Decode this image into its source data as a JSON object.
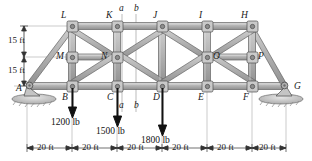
{
  "figure": {
    "type": "truss-diagram",
    "colors": {
      "member_fill": "#b9b9b9",
      "member_edge": "#5a5a5a",
      "joint_fill": "#d8d8d8",
      "joint_edge": "#4a4a4a",
      "load_arrow": "#111111",
      "dimension_line": "#7a7a7a",
      "section_line": "#9a9a9a",
      "ground_hatch": "#8c8c8c"
    }
  },
  "joints": {
    "bottom_chord": [
      {
        "id": "A",
        "label": "A",
        "x_ft": 0,
        "label_pos": "left-above"
      },
      {
        "id": "B",
        "label": "B",
        "x_ft": 20,
        "label_pos": "left-below"
      },
      {
        "id": "C",
        "label": "C",
        "x_ft": 40,
        "label_pos": "left-below"
      },
      {
        "id": "D",
        "label": "D",
        "x_ft": 60,
        "label_pos": "left-below"
      },
      {
        "id": "E",
        "label": "E",
        "x_ft": 80,
        "label_pos": "left-below"
      },
      {
        "id": "F",
        "label": "F",
        "x_ft": 100,
        "label_pos": "left-below"
      },
      {
        "id": "G",
        "label": "G",
        "x_ft": 120,
        "label_pos": "right-above"
      }
    ],
    "top_chord": [
      {
        "id": "L",
        "label": "L",
        "x_ft": 20,
        "label_pos": "left-above"
      },
      {
        "id": "K",
        "label": "K",
        "x_ft": 40,
        "label_pos": "left-above"
      },
      {
        "id": "J",
        "label": "J",
        "x_ft": 60,
        "label_pos": "left-above"
      },
      {
        "id": "I",
        "label": "I",
        "x_ft": 80,
        "label_pos": "left-above"
      },
      {
        "id": "H",
        "label": "H",
        "x_ft": 100,
        "label_pos": "left-above"
      }
    ],
    "mid_chord": [
      {
        "id": "M",
        "label": "M",
        "x_ft": 20,
        "label_pos": "left"
      },
      {
        "id": "N",
        "label": "N",
        "x_ft": 40,
        "label_pos": "left"
      },
      {
        "id": "O",
        "label": "O",
        "x_ft": 80,
        "label_pos": "right"
      },
      {
        "id": "P",
        "label": "P",
        "x_ft": 100,
        "label_pos": "right"
      }
    ]
  },
  "heights": {
    "upper_label": "15 ft",
    "lower_label": "15 ft",
    "upper_ft": 15,
    "lower_ft": 15,
    "total_ft": 30
  },
  "loads": [
    {
      "at": "B",
      "label": "1200 lb",
      "magnitude": 1200,
      "unit": "lb",
      "direction": "down"
    },
    {
      "at": "C",
      "label": "1500 lb",
      "magnitude": 1500,
      "unit": "lb",
      "direction": "down"
    },
    {
      "at": "D",
      "label": "1800 lb",
      "magnitude": 1800,
      "unit": "lb",
      "direction": "down"
    }
  ],
  "sections": [
    {
      "id": "a",
      "label_top": "a",
      "label_bottom": "a",
      "x_ft": 46
    },
    {
      "id": "b",
      "label_top": "b",
      "label_bottom": "b",
      "x_ft": 53
    }
  ],
  "spans": [
    {
      "label": "20 ft",
      "value": 20,
      "unit": "ft"
    },
    {
      "label": "20 ft",
      "value": 20,
      "unit": "ft"
    },
    {
      "label": "20 ft",
      "value": 20,
      "unit": "ft"
    },
    {
      "label": "20 ft",
      "value": 20,
      "unit": "ft"
    },
    {
      "label": "20 ft",
      "value": 20,
      "unit": "ft"
    },
    {
      "label": "20 ft",
      "value": 20,
      "unit": "ft"
    }
  ],
  "supports": [
    {
      "at": "A",
      "type": "pin"
    },
    {
      "at": "G",
      "type": "pin"
    }
  ]
}
